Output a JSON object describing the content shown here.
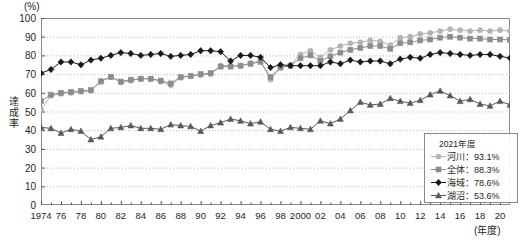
{
  "axes": {
    "y_unit": "(%)",
    "y_title": "達成率",
    "x_unit": "(年度)",
    "y_ticks": [
      "100",
      "90",
      "80",
      "70",
      "60",
      "50",
      "40",
      "30",
      "20",
      "10",
      "0"
    ],
    "x_ticks": [
      "1974",
      "76",
      "78",
      "80",
      "82",
      "84",
      "86",
      "88",
      "90",
      "92",
      "94",
      "96",
      "98",
      "2000",
      "02",
      "04",
      "06",
      "08",
      "10",
      "12",
      "14",
      "16",
      "18",
      "20"
    ]
  },
  "legend": {
    "title": "2021年度",
    "items": [
      {
        "label": "河川：93.1%",
        "marker": "circle-marker-icon",
        "color": "#b3b3b3"
      },
      {
        "label": "全体：88.3%",
        "marker": "square-marker-icon",
        "color": "#8c8c8c"
      },
      {
        "label": "海域：78.6%",
        "marker": "diamond-marker-icon",
        "color": "#1a1a1a"
      },
      {
        "label": "湖沼：53.6%",
        "marker": "triangle-marker-icon",
        "color": "#595959"
      }
    ]
  },
  "chart_data": {
    "type": "line",
    "title": "",
    "xlabel": "(年度)",
    "ylabel": "達成率",
    "ylim": [
      0,
      100
    ],
    "xlim": [
      1974,
      2021
    ],
    "grid": true,
    "legend_position": "bottom-right",
    "x": [
      1974,
      1975,
      1976,
      1977,
      1978,
      1979,
      1980,
      1981,
      1982,
      1983,
      1984,
      1985,
      1986,
      1987,
      1988,
      1989,
      1990,
      1991,
      1992,
      1993,
      1994,
      1995,
      1996,
      1997,
      1998,
      1999,
      2000,
      2001,
      2002,
      2003,
      2004,
      2005,
      2006,
      2007,
      2008,
      2009,
      2010,
      2011,
      2012,
      2013,
      2014,
      2015,
      2016,
      2017,
      2018,
      2019,
      2020,
      2021
    ],
    "series": [
      {
        "name": "河川",
        "marker": "circle",
        "color": "#b3b3b3",
        "values": [
          51.0,
          58.5,
          59.5,
          60.0,
          60.5,
          61.0,
          66.5,
          68.5,
          65.5,
          66.5,
          67.5,
          67.5,
          66.0,
          64.0,
          68.0,
          69.0,
          69.5,
          70.0,
          74.5,
          74.5,
          74.5,
          76.0,
          77.0,
          67.0,
          73.5,
          75.0,
          80.5,
          82.5,
          79.0,
          83.0,
          85.0,
          86.5,
          87.0,
          88.0,
          87.5,
          85.5,
          89.5,
          90.0,
          91.5,
          92.0,
          93.0,
          94.0,
          93.5,
          93.0,
          93.5,
          93.0,
          93.5,
          93.1
        ]
      },
      {
        "name": "全体",
        "marker": "square",
        "color": "#8c8c8c",
        "values": [
          55.5,
          59.0,
          60.0,
          60.5,
          61.0,
          61.5,
          66.0,
          68.5,
          66.0,
          67.0,
          67.5,
          67.5,
          66.5,
          65.0,
          68.5,
          69.0,
          70.0,
          70.5,
          74.0,
          74.0,
          74.5,
          75.5,
          76.5,
          68.5,
          73.5,
          74.5,
          78.5,
          80.0,
          77.0,
          79.5,
          81.5,
          83.0,
          84.0,
          85.0,
          85.0,
          83.5,
          86.5,
          87.0,
          88.0,
          88.5,
          89.5,
          90.0,
          89.5,
          89.0,
          89.0,
          88.5,
          88.5,
          88.3
        ]
      },
      {
        "name": "海域",
        "marker": "diamond",
        "color": "#1a1a1a",
        "values": [
          70.5,
          72.5,
          76.5,
          76.5,
          75.0,
          77.5,
          78.5,
          80.0,
          81.5,
          81.0,
          80.0,
          80.5,
          81.0,
          79.5,
          80.0,
          80.5,
          82.5,
          82.5,
          82.0,
          77.0,
          80.0,
          80.0,
          79.0,
          73.5,
          75.0,
          74.5,
          74.5,
          74.5,
          74.5,
          76.5,
          75.5,
          77.5,
          76.5,
          77.0,
          77.0,
          75.5,
          78.0,
          79.0,
          78.5,
          80.5,
          81.5,
          81.0,
          80.5,
          80.0,
          80.5,
          80.5,
          79.5,
          78.6
        ]
      },
      {
        "name": "湖沼",
        "marker": "triangle",
        "color": "#595959",
        "values": [
          41.5,
          41.0,
          38.5,
          40.5,
          39.5,
          35.0,
          36.5,
          41.0,
          41.5,
          42.5,
          41.0,
          41.0,
          40.5,
          43.0,
          42.5,
          42.0,
          39.5,
          42.5,
          44.0,
          46.0,
          45.0,
          43.5,
          44.5,
          40.5,
          39.5,
          41.5,
          41.0,
          40.5,
          45.0,
          43.5,
          46.0,
          50.5,
          55.0,
          53.5,
          54.0,
          57.0,
          55.5,
          54.5,
          56.0,
          59.0,
          61.0,
          58.5,
          55.5,
          56.5,
          54.0,
          53.0,
          55.5,
          53.6
        ]
      }
    ]
  }
}
